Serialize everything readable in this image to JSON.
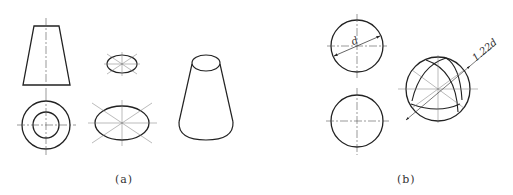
{
  "figure": {
    "panel_a": {
      "caption": "(a)",
      "views": [
        "front-view-truncated-cone",
        "top-view-concentric-circles",
        "small-ellipse-construction",
        "large-ellipse-construction",
        "isometric-truncated-cone"
      ]
    },
    "panel_b": {
      "caption": "(b)",
      "dimension_d": "d",
      "dimension_iso": "1.22d",
      "views": [
        "front-view-sphere",
        "top-view-sphere",
        "isometric-sphere"
      ]
    }
  },
  "colors": {
    "line": "#222222",
    "centerline": "#555555",
    "background": "#ffffff"
  }
}
